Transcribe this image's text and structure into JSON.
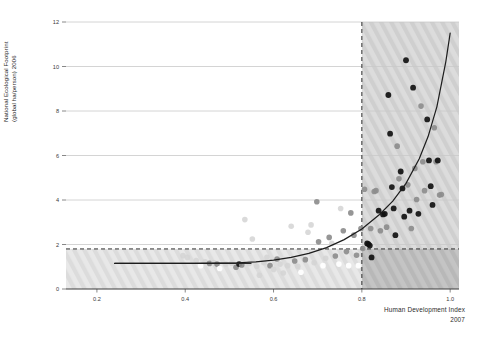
{
  "chart_data": {
    "type": "scatter",
    "title": "",
    "xlabel": "Human Development Index",
    "xlabel_sub": "2007",
    "ylabel_line1": "National Ecological Footprint",
    "ylabel_line2": "(global ha/person) 2006",
    "xlim": [
      0.13,
      1.02
    ],
    "ylim": [
      0,
      12
    ],
    "xticks": [
      0.2,
      0.4,
      0.6,
      0.8,
      1.0
    ],
    "xtick_labels": [
      "0.2",
      "0.4",
      "0.6",
      "0.8",
      "1.0"
    ],
    "yticks": [
      0,
      2,
      4,
      6,
      8,
      10,
      12
    ],
    "ytick_labels": [
      "0",
      "2",
      "4",
      "6",
      "8",
      "10",
      "12"
    ],
    "grid": "horizontal",
    "legend": "none",
    "threshold_hdi": 0.8,
    "threshold_footprint": 1.8,
    "threshold_hdi_style": "dashed-vertical",
    "threshold_footprint_style": "dashed-horizontal",
    "quadrant_note_hatched": "hatched shading marks HDI >= 0.8 and footprint <= 1.8 biocapacity regions",
    "colors": {
      "axis": "#3d3d3d",
      "grid": "#c9c9c9",
      "dashed": "#2e2e2e",
      "trend": "#1d1d1d",
      "hatch_light": "#dedede",
      "hatch_dark": "#b9b9b9",
      "point_dark": "#111111",
      "point_mid": "#8d8d8d",
      "point_light": "#d4d4d4",
      "point_white": "#ffffff"
    },
    "trend_curve": {
      "name": "fitted exponential trend",
      "x": [
        0.24,
        0.3,
        0.36,
        0.42,
        0.48,
        0.52,
        0.56,
        0.6,
        0.64,
        0.68,
        0.72,
        0.76,
        0.8,
        0.84,
        0.87,
        0.9,
        0.93,
        0.95,
        0.97,
        0.99,
        1.0
      ],
      "y": [
        1.15,
        1.15,
        1.15,
        1.15,
        1.16,
        1.18,
        1.22,
        1.3,
        1.42,
        1.6,
        1.86,
        2.22,
        2.7,
        3.35,
        3.95,
        4.75,
        5.85,
        6.85,
        8.2,
        10.2,
        11.5
      ]
    },
    "flat_segment": {
      "name": "low-HDI flat reference segment",
      "x": [
        0.24,
        0.55
      ],
      "y": [
        1.15,
        1.15
      ]
    },
    "series": [
      {
        "name": "countries",
        "points": [
          {
            "x": 0.395,
            "y": 1.5,
            "shade": "light"
          },
          {
            "x": 0.405,
            "y": 1.42,
            "shade": "light"
          },
          {
            "x": 0.425,
            "y": 1.28,
            "shade": "light"
          },
          {
            "x": 0.435,
            "y": 1.05,
            "shade": "white"
          },
          {
            "x": 0.445,
            "y": 1.22,
            "shade": "light"
          },
          {
            "x": 0.455,
            "y": 1.15,
            "shade": "mid"
          },
          {
            "x": 0.465,
            "y": 1.18,
            "shade": "light"
          },
          {
            "x": 0.472,
            "y": 1.12,
            "shade": "mid"
          },
          {
            "x": 0.478,
            "y": 0.92,
            "shade": "white"
          },
          {
            "x": 0.492,
            "y": 1.12,
            "shade": "light"
          },
          {
            "x": 0.505,
            "y": 1.16,
            "shade": "light"
          },
          {
            "x": 0.515,
            "y": 0.98,
            "shade": "mid"
          },
          {
            "x": 0.522,
            "y": 1.12,
            "shade": "dark"
          },
          {
            "x": 0.528,
            "y": 1.08,
            "shade": "mid"
          },
          {
            "x": 0.535,
            "y": 3.12,
            "shade": "light"
          },
          {
            "x": 0.545,
            "y": 1.15,
            "shade": "light"
          },
          {
            "x": 0.552,
            "y": 2.25,
            "shade": "light"
          },
          {
            "x": 0.562,
            "y": 1.02,
            "shade": "light"
          },
          {
            "x": 0.568,
            "y": 0.62,
            "shade": "light"
          },
          {
            "x": 0.578,
            "y": 1.18,
            "shade": "light"
          },
          {
            "x": 0.585,
            "y": 1.42,
            "shade": "light"
          },
          {
            "x": 0.592,
            "y": 1.05,
            "shade": "mid"
          },
          {
            "x": 0.6,
            "y": 0.88,
            "shade": "light"
          },
          {
            "x": 0.608,
            "y": 1.35,
            "shade": "mid"
          },
          {
            "x": 0.615,
            "y": 1.12,
            "shade": "light"
          },
          {
            "x": 0.622,
            "y": 0.72,
            "shade": "light"
          },
          {
            "x": 0.632,
            "y": 1.05,
            "shade": "light"
          },
          {
            "x": 0.64,
            "y": 2.82,
            "shade": "light"
          },
          {
            "x": 0.648,
            "y": 1.26,
            "shade": "mid"
          },
          {
            "x": 0.655,
            "y": 1.02,
            "shade": "light"
          },
          {
            "x": 0.662,
            "y": 0.75,
            "shade": "white"
          },
          {
            "x": 0.672,
            "y": 1.32,
            "shade": "mid"
          },
          {
            "x": 0.678,
            "y": 2.55,
            "shade": "light"
          },
          {
            "x": 0.685,
            "y": 2.88,
            "shade": "light"
          },
          {
            "x": 0.692,
            "y": 1.18,
            "shade": "light"
          },
          {
            "x": 0.698,
            "y": 3.92,
            "shade": "mid"
          },
          {
            "x": 0.702,
            "y": 2.12,
            "shade": "mid"
          },
          {
            "x": 0.712,
            "y": 1.05,
            "shade": "white"
          },
          {
            "x": 0.718,
            "y": 1.38,
            "shade": "light"
          },
          {
            "x": 0.726,
            "y": 2.32,
            "shade": "mid"
          },
          {
            "x": 0.732,
            "y": 2.05,
            "shade": "light"
          },
          {
            "x": 0.74,
            "y": 1.48,
            "shade": "mid"
          },
          {
            "x": 0.748,
            "y": 1.12,
            "shade": "white"
          },
          {
            "x": 0.752,
            "y": 3.62,
            "shade": "light"
          },
          {
            "x": 0.758,
            "y": 2.62,
            "shade": "mid"
          },
          {
            "x": 0.765,
            "y": 1.68,
            "shade": "mid"
          },
          {
            "x": 0.77,
            "y": 1.05,
            "shade": "white"
          },
          {
            "x": 0.775,
            "y": 3.42,
            "shade": "mid"
          },
          {
            "x": 0.782,
            "y": 2.42,
            "shade": "mid"
          },
          {
            "x": 0.788,
            "y": 1.52,
            "shade": "mid"
          },
          {
            "x": 0.792,
            "y": 1.05,
            "shade": "white"
          },
          {
            "x": 0.798,
            "y": 2.72,
            "shade": "mid"
          },
          {
            "x": 0.802,
            "y": 1.82,
            "shade": "mid"
          },
          {
            "x": 0.806,
            "y": 4.48,
            "shade": "mid"
          },
          {
            "x": 0.812,
            "y": 2.05,
            "shade": "dark"
          },
          {
            "x": 0.815,
            "y": 2.02,
            "shade": "dark"
          },
          {
            "x": 0.818,
            "y": 1.95,
            "shade": "dark"
          },
          {
            "x": 0.82,
            "y": 2.72,
            "shade": "mid"
          },
          {
            "x": 0.822,
            "y": 1.42,
            "shade": "dark"
          },
          {
            "x": 0.828,
            "y": 4.38,
            "shade": "mid"
          },
          {
            "x": 0.832,
            "y": 4.42,
            "shade": "mid"
          },
          {
            "x": 0.838,
            "y": 3.52,
            "shade": "dark"
          },
          {
            "x": 0.842,
            "y": 2.62,
            "shade": "mid"
          },
          {
            "x": 0.848,
            "y": 3.35,
            "shade": "dark"
          },
          {
            "x": 0.852,
            "y": 3.38,
            "shade": "dark"
          },
          {
            "x": 0.856,
            "y": 2.78,
            "shade": "mid"
          },
          {
            "x": 0.86,
            "y": 8.72,
            "shade": "dark"
          },
          {
            "x": 0.864,
            "y": 6.98,
            "shade": "dark"
          },
          {
            "x": 0.868,
            "y": 4.58,
            "shade": "dark"
          },
          {
            "x": 0.872,
            "y": 3.62,
            "shade": "dark"
          },
          {
            "x": 0.876,
            "y": 2.42,
            "shade": "dark"
          },
          {
            "x": 0.88,
            "y": 6.42,
            "shade": "mid"
          },
          {
            "x": 0.884,
            "y": 4.95,
            "shade": "mid"
          },
          {
            "x": 0.888,
            "y": 5.28,
            "shade": "dark"
          },
          {
            "x": 0.892,
            "y": 4.52,
            "shade": "dark"
          },
          {
            "x": 0.896,
            "y": 3.25,
            "shade": "dark"
          },
          {
            "x": 0.9,
            "y": 10.28,
            "shade": "dark"
          },
          {
            "x": 0.904,
            "y": 4.68,
            "shade": "mid"
          },
          {
            "x": 0.908,
            "y": 3.52,
            "shade": "dark"
          },
          {
            "x": 0.912,
            "y": 2.72,
            "shade": "mid"
          },
          {
            "x": 0.916,
            "y": 9.05,
            "shade": "dark"
          },
          {
            "x": 0.92,
            "y": 5.42,
            "shade": "mid"
          },
          {
            "x": 0.924,
            "y": 4.02,
            "shade": "mid"
          },
          {
            "x": 0.928,
            "y": 3.38,
            "shade": "dark"
          },
          {
            "x": 0.934,
            "y": 8.22,
            "shade": "mid"
          },
          {
            "x": 0.938,
            "y": 5.72,
            "shade": "mid"
          },
          {
            "x": 0.942,
            "y": 4.42,
            "shade": "mid"
          },
          {
            "x": 0.948,
            "y": 7.62,
            "shade": "dark"
          },
          {
            "x": 0.952,
            "y": 5.78,
            "shade": "dark"
          },
          {
            "x": 0.956,
            "y": 4.62,
            "shade": "dark"
          },
          {
            "x": 0.96,
            "y": 3.78,
            "shade": "dark"
          },
          {
            "x": 0.964,
            "y": 7.25,
            "shade": "mid"
          },
          {
            "x": 0.968,
            "y": 5.72,
            "shade": "mid"
          },
          {
            "x": 0.972,
            "y": 5.78,
            "shade": "dark"
          },
          {
            "x": 0.976,
            "y": 4.22,
            "shade": "mid"
          },
          {
            "x": 0.98,
            "y": 4.25,
            "shade": "mid"
          }
        ]
      }
    ]
  }
}
